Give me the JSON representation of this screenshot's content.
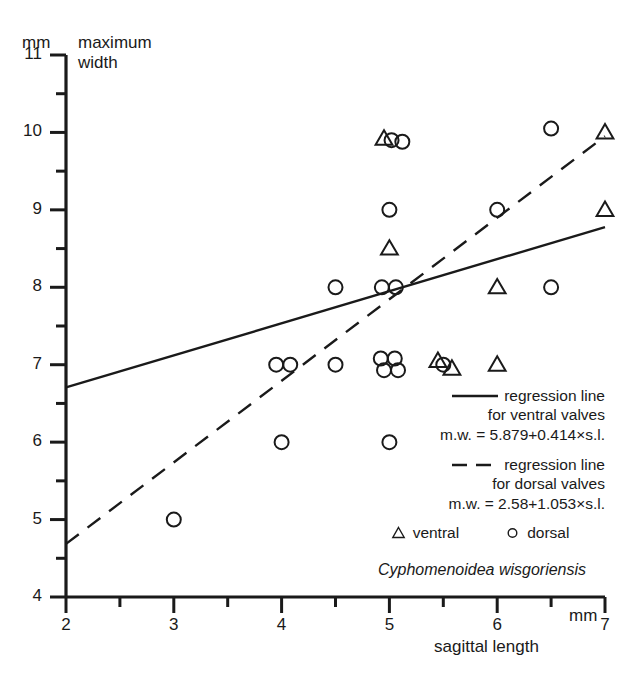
{
  "chart_data": {
    "type": "scatter",
    "title": "Cyphomenoidea wisgoriensis",
    "xlabel": "sagittal length",
    "ylabel": "maximum width",
    "x_unit": "mm",
    "y_unit": "mm",
    "xlim": [
      2,
      7
    ],
    "ylim": [
      4,
      11
    ],
    "x_ticks": [
      2,
      3,
      4,
      5,
      6,
      7
    ],
    "x_tick_labels": [
      "2",
      "3",
      "4",
      "5",
      "6",
      "7"
    ],
    "x_minor_ticks": [
      2.5,
      3.5,
      4.5,
      5.5,
      6.5
    ],
    "y_ticks": [
      4,
      5,
      6,
      7,
      8,
      9,
      10,
      11
    ],
    "y_tick_labels": [
      "4",
      "5",
      "6",
      "7",
      "8",
      "9",
      "10",
      "11"
    ],
    "y_minor_ticks": [
      4.5,
      5.5,
      6.5,
      7.5,
      8.5,
      9.5,
      10.5
    ],
    "grid": false,
    "legend_position": "center-right",
    "series": [
      {
        "name": "ventral",
        "marker": "triangle",
        "points": [
          {
            "x": 4.95,
            "y": 9.92
          },
          {
            "x": 5.0,
            "y": 8.5
          },
          {
            "x": 5.45,
            "y": 7.05
          },
          {
            "x": 5.58,
            "y": 6.95
          },
          {
            "x": 6.0,
            "y": 8.0
          },
          {
            "x": 6.0,
            "y": 7.0
          },
          {
            "x": 7.0,
            "y": 10.0
          },
          {
            "x": 7.0,
            "y": 9.0
          }
        ]
      },
      {
        "name": "dorsal",
        "marker": "circle",
        "points": [
          {
            "x": 3.0,
            "y": 5.0
          },
          {
            "x": 4.0,
            "y": 6.0
          },
          {
            "x": 3.95,
            "y": 7.0
          },
          {
            "x": 4.08,
            "y": 7.0
          },
          {
            "x": 4.5,
            "y": 7.0
          },
          {
            "x": 4.5,
            "y": 8.0
          },
          {
            "x": 4.92,
            "y": 7.08
          },
          {
            "x": 5.05,
            "y": 7.08
          },
          {
            "x": 4.95,
            "y": 6.93
          },
          {
            "x": 5.08,
            "y": 6.93
          },
          {
            "x": 5.0,
            "y": 6.0
          },
          {
            "x": 4.93,
            "y": 8.0
          },
          {
            "x": 5.06,
            "y": 8.0
          },
          {
            "x": 5.0,
            "y": 9.0
          },
          {
            "x": 5.02,
            "y": 9.9
          },
          {
            "x": 5.12,
            "y": 9.88
          },
          {
            "x": 5.5,
            "y": 7.0
          },
          {
            "x": 6.0,
            "y": 9.0
          },
          {
            "x": 6.5,
            "y": 8.0
          },
          {
            "x": 6.5,
            "y": 10.05
          }
        ]
      }
    ],
    "regression_lines": [
      {
        "name": "regression line for ventral valves",
        "style": "solid",
        "equation": "m.w. = 5.879+0.414×s.l.",
        "intercept": 5.879,
        "slope": 0.414,
        "x_start": 2,
        "x_end": 7
      },
      {
        "name": "regression line for dorsal valves",
        "style": "dashed",
        "equation": "m.w. = 2.58+1.053×s.l.",
        "intercept": 2.58,
        "slope": 1.053,
        "x_start": 2,
        "x_end": 7
      }
    ]
  },
  "axes": {
    "y_unit_label": "mm",
    "y_title_line1": "maximum",
    "y_title_line2": "width",
    "x_title": "sagittal length",
    "x_unit_label": "mm"
  },
  "legend": {
    "ventral_line_label_1": "regression line",
    "ventral_line_label_2": "for ventral valves",
    "ventral_equation": "m.w. = 5.879+0.414×s.l.",
    "dorsal_line_label_1": "regression line",
    "dorsal_line_label_2": "for dorsal valves",
    "dorsal_equation": "m.w. = 2.58+1.053×s.l.",
    "key_ventral": "ventral",
    "key_dorsal": "dorsal"
  },
  "caption": {
    "species": "Cyphomenoidea wisgoriensis"
  }
}
